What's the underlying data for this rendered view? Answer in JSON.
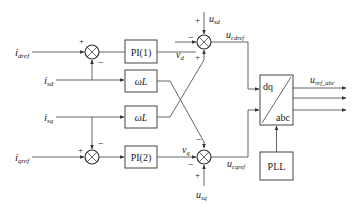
{
  "diagram": {
    "type": "control-block-diagram",
    "inputs": {
      "idref": {
        "main": "i",
        "sub": "dref"
      },
      "isd": {
        "main": "i",
        "sub": "sd"
      },
      "isq": {
        "main": "i",
        "sub": "sq"
      },
      "iqref": {
        "main": "i",
        "sub": "qref"
      },
      "usd": {
        "main": "u",
        "sub": "sd"
      },
      "usq": {
        "main": "u",
        "sub": "sq"
      }
    },
    "blocks": {
      "pi1": "PI(1)",
      "pi2": "PI(2)",
      "wl1": "ωL",
      "wl2": "ωL",
      "dq_top": "dq",
      "dq_bottom": "abc",
      "pll": "PLL"
    },
    "signals": {
      "vd": {
        "main": "v",
        "sub": "d"
      },
      "vq": {
        "main": "v",
        "sub": "q"
      },
      "ucdref": {
        "main": "u",
        "sub": "cdref"
      },
      "ucqref": {
        "main": "u",
        "sub": "cqref"
      },
      "uref_abc": {
        "main": "u",
        "sub": "ref_abc"
      }
    },
    "signs": {
      "plus": "+",
      "minus": "−"
    }
  }
}
